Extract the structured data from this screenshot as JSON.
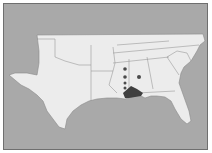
{
  "map": {
    "title": "",
    "region": "Southeastern United States",
    "colors": {
      "water": "#a9a9a9",
      "land": "#ececec",
      "border": "#8a8a8a",
      "range": "#3f3f3f",
      "point": "#4a4a4a"
    },
    "states": [
      "Texas",
      "Oklahoma",
      "Arkansas",
      "Louisiana",
      "Mississippi",
      "Alabama",
      "Tennessee",
      "Kentucky",
      "Georgia",
      "Florida",
      "South Carolina",
      "North Carolina",
      "Virginia"
    ],
    "shaded_range": {
      "label": "Distribution range",
      "location": "Coastal Mississippi / Alabama / Florida panhandle"
    },
    "points": [
      {
        "label": "Record 1",
        "x": 124,
        "y": 68
      },
      {
        "label": "Record 2",
        "x": 124,
        "y": 76
      },
      {
        "label": "Record 3",
        "x": 124,
        "y": 82
      },
      {
        "label": "Record 4",
        "x": 124,
        "y": 87
      },
      {
        "label": "Record 5",
        "x": 138,
        "y": 76
      }
    ]
  }
}
